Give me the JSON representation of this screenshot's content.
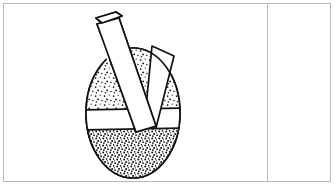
{
  "panel": {
    "background_color": "#ffffff",
    "border_color": "#b9b9b9",
    "divider_color": "#b9b9b9"
  },
  "figure": {
    "title": "Mortar and pestle cross-section",
    "caption": "",
    "style": "black and white stippled line drawing",
    "ink_color": "#111111",
    "fill_color": "#ffffff",
    "parts": [
      {
        "name": "mortar-bowl",
        "label": "Mortar bowl",
        "shape": "ellipse",
        "center_x": 133,
        "center_y": 113,
        "radius_x": 48,
        "radius_y": 66
      },
      {
        "name": "upper-stipple-left",
        "label": "Ground contents, upper left",
        "texture": "stipple",
        "density": "medium"
      },
      {
        "name": "upper-stipple-right",
        "label": "Ground contents, upper right",
        "texture": "stipple",
        "density": "medium"
      },
      {
        "name": "lower-stipple",
        "label": "Ground contents, lower half",
        "texture": "stipple",
        "density": "dense"
      },
      {
        "name": "pestle-shaft",
        "label": "Pestle shaft",
        "orientation": "diagonal, tilted right-to-left from top"
      },
      {
        "name": "pestle-cap",
        "label": "Pestle handle end cap",
        "shape": "ellipse-parallelogram"
      },
      {
        "name": "pestle-wedge",
        "label": "Second pestle wedge forming V shape"
      },
      {
        "name": "white-band",
        "label": "Unshaded horizontal band",
        "orientation": "horizontal"
      }
    ]
  },
  "blank_panel": {
    "label": "Empty panel",
    "content": ""
  }
}
